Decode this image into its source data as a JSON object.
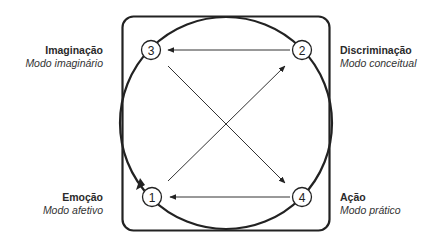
{
  "diagram": {
    "nodes": [
      {
        "id": "1",
        "number": "1",
        "title": "Emoção",
        "subtitle": "Modo afetivo"
      },
      {
        "id": "2",
        "number": "2",
        "title": "Discriminação",
        "subtitle": "Modo conceitual"
      },
      {
        "id": "3",
        "number": "3",
        "title": "Imaginação",
        "subtitle": "Modo imaginário"
      },
      {
        "id": "4",
        "number": "4",
        "title": "Ação",
        "subtitle": "Modo prático"
      }
    ],
    "edges": [
      {
        "from": "2",
        "to": "3"
      },
      {
        "from": "4",
        "to": "1"
      },
      {
        "from": "1",
        "to": "2"
      },
      {
        "from": "3",
        "to": "4"
      }
    ],
    "colors": {
      "stroke": "#222222",
      "background": "#ffffff"
    }
  }
}
